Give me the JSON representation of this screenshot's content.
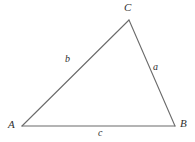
{
  "figure": {
    "type": "triangle-diagram",
    "background_color": "#ffffff",
    "stroke_color": "#6b6b6b",
    "text_color": "#2f2f2f"
  },
  "vertices": [
    {
      "name": "A",
      "label": "A",
      "x": 22,
      "y": 126
    },
    {
      "name": "B",
      "label": "B",
      "x": 175,
      "y": 126
    },
    {
      "name": "C",
      "label": "C",
      "x": 129,
      "y": 20
    }
  ],
  "sides": [
    {
      "name": "a",
      "label": "a",
      "from": "B",
      "to": "C"
    },
    {
      "name": "b",
      "label": "b",
      "from": "A",
      "to": "C"
    },
    {
      "name": "c",
      "label": "c",
      "from": "A",
      "to": "B"
    }
  ]
}
